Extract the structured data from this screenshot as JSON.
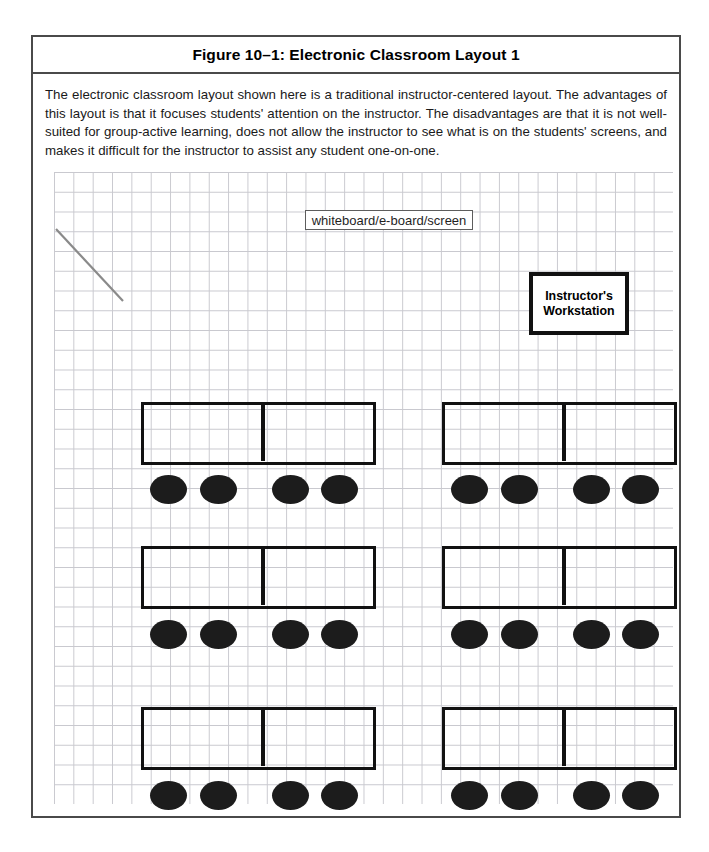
{
  "figure": {
    "title": "Figure 10–1: Electronic Classroom Layout 1",
    "description": "The electronic classroom layout shown here is a traditional instructor-centered layout. The advantages of this layout is that it focuses students' attention on the instructor. The disadvantages are that it is not well-suited for group-active learning, does not allow the instructor to see what is on the students' screens, and makes it difficult for the instructor to assist any student one-on-one."
  },
  "diagram": {
    "whiteboard": {
      "label": "whiteboard/e-board/screen"
    },
    "instructor_workstation": {
      "label_line1": "Instructor's",
      "label_line2": "Workstation"
    },
    "pointer_line": {
      "name": "diagonal-pointer-line",
      "x1": 2,
      "y1": 57,
      "x2": 69,
      "y2": 129,
      "color": "#8a8a8a"
    },
    "grid": {
      "cell_width": 19.35,
      "cell_height": 19.75,
      "line_color": "#c9c9cf"
    },
    "colors": {
      "table_stroke": "#111111",
      "chair_fill": "#1c1c1c",
      "frame": "#4a4a4a",
      "whiteboard_stroke": "#5d5d5d"
    },
    "table_groups": [
      {
        "id": "row1-left",
        "x": 87,
        "y": 230,
        "width": 235,
        "height": 63,
        "divider_x": 117
      },
      {
        "id": "row1-right",
        "x": 388,
        "y": 230,
        "width": 235,
        "height": 63,
        "divider_x": 117
      },
      {
        "id": "row2-left",
        "x": 87,
        "y": 374,
        "width": 235,
        "height": 63,
        "divider_x": 117
      },
      {
        "id": "row2-right",
        "x": 388,
        "y": 374,
        "width": 235,
        "height": 63,
        "divider_x": 117
      },
      {
        "id": "row3-left",
        "x": 87,
        "y": 535,
        "width": 235,
        "height": 63,
        "divider_x": 117
      },
      {
        "id": "row3-right",
        "x": 388,
        "y": 535,
        "width": 235,
        "height": 63,
        "divider_x": 117
      }
    ],
    "chairs": [
      {
        "id": "r1c1",
        "x": 96,
        "y": 303
      },
      {
        "id": "r1c2",
        "x": 146,
        "y": 303
      },
      {
        "id": "r1c3",
        "x": 218,
        "y": 303
      },
      {
        "id": "r1c4",
        "x": 267,
        "y": 303
      },
      {
        "id": "r1c5",
        "x": 397,
        "y": 303
      },
      {
        "id": "r1c6",
        "x": 447,
        "y": 303
      },
      {
        "id": "r1c7",
        "x": 519,
        "y": 303
      },
      {
        "id": "r1c8",
        "x": 568,
        "y": 303
      },
      {
        "id": "r2c1",
        "x": 96,
        "y": 448
      },
      {
        "id": "r2c2",
        "x": 146,
        "y": 448
      },
      {
        "id": "r2c3",
        "x": 218,
        "y": 448
      },
      {
        "id": "r2c4",
        "x": 267,
        "y": 448
      },
      {
        "id": "r2c5",
        "x": 397,
        "y": 448
      },
      {
        "id": "r2c6",
        "x": 447,
        "y": 448
      },
      {
        "id": "r2c7",
        "x": 519,
        "y": 448
      },
      {
        "id": "r2c8",
        "x": 568,
        "y": 448
      },
      {
        "id": "r3c1",
        "x": 96,
        "y": 609
      },
      {
        "id": "r3c2",
        "x": 146,
        "y": 609
      },
      {
        "id": "r3c3",
        "x": 218,
        "y": 609
      },
      {
        "id": "r3c4",
        "x": 267,
        "y": 609
      },
      {
        "id": "r3c5",
        "x": 397,
        "y": 609
      },
      {
        "id": "r3c6",
        "x": 447,
        "y": 609
      },
      {
        "id": "r3c7",
        "x": 519,
        "y": 609
      },
      {
        "id": "r3c8",
        "x": 568,
        "y": 609
      }
    ]
  }
}
